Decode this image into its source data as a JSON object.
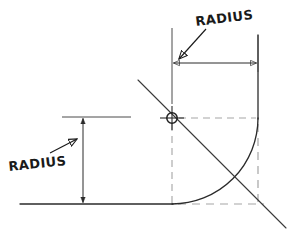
{
  "drawing": {
    "title": "Fillet Radius Construction",
    "canvas": {
      "width": 292,
      "height": 238,
      "background": "#ffffff"
    },
    "ink_color": "#2b2b2b",
    "construction_color": "#9a9a9a",
    "labels": {
      "top_radius": "RADIUS",
      "left_radius": "RADIUS"
    },
    "geometry": {
      "center_point": {
        "x": 172,
        "y": 118
      },
      "center_marker_radius": 5,
      "arc_radius": 86,
      "arc_start": {
        "x": 172,
        "y": 204
      },
      "arc_end": {
        "x": 258,
        "y": 118
      },
      "bottom_line": {
        "x1": 20,
        "y1": 204,
        "x2": 172,
        "y2": 204
      },
      "bottom_dashed": {
        "x1": 172,
        "y1": 204,
        "x2": 262,
        "y2": 204
      },
      "right_line": {
        "x1": 258,
        "y1": 35,
        "x2": 258,
        "y2": 118
      },
      "right_dashed": {
        "x1": 258,
        "y1": 118,
        "x2": 258,
        "y2": 206
      },
      "diagonal": {
        "x1": 138,
        "y1": 80,
        "x2": 286,
        "y2": 228
      },
      "horizontal_dim": {
        "x1": 172,
        "y1": 63,
        "x2": 258,
        "y2": 63
      },
      "vertical_dim": {
        "x1": 83,
        "y1": 117,
        "x2": 83,
        "y2": 204
      },
      "top_extension": {
        "x1": 172,
        "y1": 28,
        "x2": 172,
        "y2": 100
      },
      "left_extension": {
        "x1": 62,
        "y1": 117,
        "x2": 130,
        "y2": 117
      },
      "center_dashed_h": {
        "x1": 178,
        "y1": 118,
        "x2": 258,
        "y2": 118
      },
      "center_dashed_v": {
        "x1": 172,
        "y1": 124,
        "x2": 172,
        "y2": 204
      }
    },
    "label_positions": {
      "top_radius": {
        "x": 196,
        "y": 26
      },
      "left_radius": {
        "x": 8,
        "y": 170
      }
    },
    "leaders": {
      "top": {
        "x1": 204,
        "y1": 30,
        "x2": 178,
        "y2": 60
      },
      "left": {
        "x1": 52,
        "y1": 152,
        "x2": 78,
        "y2": 138
      }
    }
  }
}
